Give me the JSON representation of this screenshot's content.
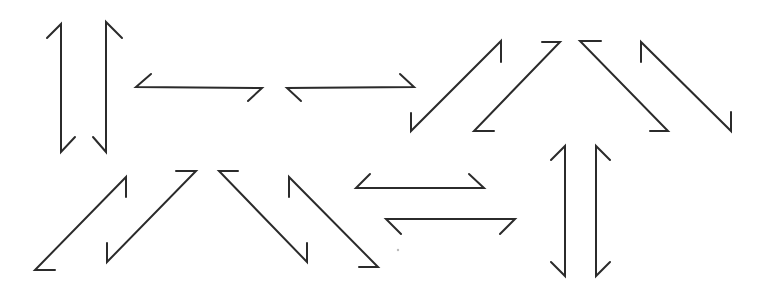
{
  "diagram": {
    "title": "",
    "background": "#ffffff",
    "stroke_color": "#2b2b2b",
    "stroke_width": 2,
    "speck": {
      "x": 398,
      "y": 250,
      "color": "#bbbbbb"
    },
    "arrows": [
      {
        "id": "vertical-up-left",
        "direction": "up",
        "d": "M47,38 L61,24 L61,152 L75,137"
      },
      {
        "id": "vertical-down-right",
        "direction": "down",
        "d": "M122,38 L106,22 L106,152 L93,137"
      },
      {
        "id": "horizontal-left-top",
        "direction": "left",
        "d": "M151,74 L136,87 L262,88 L248,101"
      },
      {
        "id": "horizontal-right-top",
        "direction": "right",
        "d": "M301,101 L287,88 L414,87 L400,74"
      },
      {
        "id": "diagonal-up-right-1",
        "direction": "up-right",
        "d": "M411,113 L411,131 L501,41 L501,62"
      },
      {
        "id": "diagonal-up-right-2",
        "direction": "up-right",
        "d": "M494,131 L474,131 L560,42 L542,42"
      },
      {
        "id": "diagonal-down-right-1",
        "direction": "down-right",
        "d": "M601,41 L580,41 L668,131 L650,131"
      },
      {
        "id": "diagonal-down-right-2",
        "direction": "down-right",
        "d": "M641,62 L641,42 L731,131 L731,112"
      },
      {
        "id": "diagonal-up-right-3",
        "direction": "up-right",
        "d": "M55,270 L35,270 L126,177 L126,197"
      },
      {
        "id": "diagonal-up-right-4",
        "direction": "up-right",
        "d": "M107,243 L107,262 L196,171 L176,171"
      },
      {
        "id": "diagonal-down-right-3",
        "direction": "down-right",
        "d": "M238,171 L219,171 L307,262 L307,243"
      },
      {
        "id": "diagonal-down-right-4",
        "direction": "down-right",
        "d": "M289,197 L289,177 L378,267 L359,267"
      },
      {
        "id": "horizontal-double-upper",
        "direction": "both",
        "d": "M370,174 L356,188 L484,188 L469,174"
      },
      {
        "id": "horizontal-double-lower",
        "direction": "both",
        "d": "M401,234 L386,219 L515,219 L500,234"
      },
      {
        "id": "vertical-double-left",
        "direction": "both",
        "d": "M551,160 L565,146 L565,276 L551,262"
      },
      {
        "id": "vertical-double-right",
        "direction": "both",
        "d": "M610,160 L596,146 L596,276 L610,262"
      }
    ]
  }
}
